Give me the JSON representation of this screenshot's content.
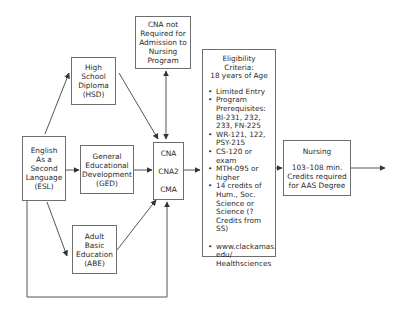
{
  "diagram": {
    "type": "flowchart",
    "nodes": {
      "esl": {
        "lines": [
          "English",
          "As a",
          "Second",
          "Language",
          "(ESL)"
        ]
      },
      "hsd": {
        "lines": [
          "High",
          "School",
          "Diploma",
          "(HSD)"
        ]
      },
      "ged": {
        "lines": [
          "General",
          "Educational",
          "Development",
          "(GED)"
        ]
      },
      "abe": {
        "lines": [
          "Adult",
          "Basic",
          "Education",
          "(ABE)"
        ]
      },
      "cna_not_required": {
        "lines": [
          "CNA not",
          "Required for",
          "Admission to",
          "Nursing",
          "Program"
        ]
      },
      "cna_group": {
        "items": [
          "CNA",
          "CNA2",
          "CMA"
        ]
      },
      "eligibility": {
        "header": [
          "Eligibility Criteria:",
          "18 years of Age"
        ],
        "bullets": [
          [
            "Limited Entry"
          ],
          [
            "Program",
            "Prerequisites:",
            "BI-231, 232,",
            "233, FN-225"
          ],
          [
            "WR-121, 122,",
            "PSY-215"
          ],
          [
            "CS-120 or exam"
          ],
          [
            "MTH-095 or",
            "higher"
          ],
          [
            "14 credits of",
            "Hum., Soc.",
            "Science or",
            "Science (?",
            "Credits from SS)"
          ],
          [
            "www.clackamas.",
            "edu/",
            "Healthsciences"
          ]
        ]
      },
      "nursing": {
        "lines": [
          "Nursing",
          "",
          "103–108 min.",
          "Credits required",
          "for AAS Degree"
        ]
      }
    },
    "edges": [
      {
        "from": "esl",
        "to": "hsd"
      },
      {
        "from": "esl",
        "to": "ged"
      },
      {
        "from": "esl",
        "to": "abe"
      },
      {
        "from": "esl",
        "to": "cna_group",
        "note": "loop along bottom"
      },
      {
        "from": "hsd",
        "to": "cna_group"
      },
      {
        "from": "ged",
        "to": "cna_group"
      },
      {
        "from": "abe",
        "to": "cna_group"
      },
      {
        "from": "cna_group",
        "to": "cna_not_required",
        "bidirectional": true
      },
      {
        "from": "cna_group",
        "to": "eligibility"
      },
      {
        "from": "eligibility",
        "to": "nursing"
      },
      {
        "from": "nursing",
        "to": "exit"
      }
    ],
    "colors": {
      "line": "#555555",
      "border": "#6e6e6e",
      "text": "#2a2a2a"
    }
  }
}
